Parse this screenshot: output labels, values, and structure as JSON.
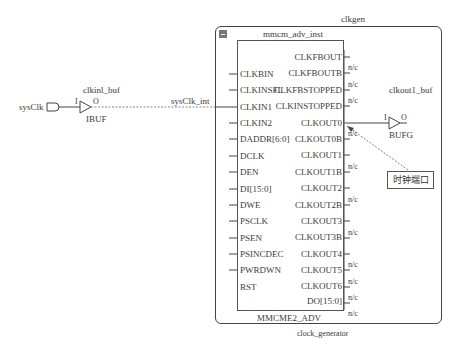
{
  "diagram": {
    "type": "schematic",
    "top_module": {
      "instance_name": "clkgen",
      "module_name": "clock_generator"
    },
    "primitive": {
      "instance_name": "mmcm_adv_inst",
      "cell_type": "MMCME2_ADV",
      "inputs": [
        "CLKBIN",
        "CLKINSFL",
        "CLKIN1",
        "CLKIN2",
        "DADDR[6:0]",
        "DCLK",
        "DEN",
        "DI[15:0]",
        "DWE",
        "PSCLK",
        "PSEN",
        "PSINCDEC",
        "PWRDWN",
        "RST"
      ],
      "outputs": [
        {
          "name": "CLKFBOUT",
          "nc": ""
        },
        {
          "name": "CLKFBOUTB",
          "nc": "n/c"
        },
        {
          "name": "CLKFBSTOPPED",
          "nc": "n/c"
        },
        {
          "name": "CLKINSTOPPED",
          "nc": "n/c"
        },
        {
          "name": "CLKOUT0",
          "nc": ""
        },
        {
          "name": "CLKOUT0B",
          "nc": "n/c"
        },
        {
          "name": "CLKOUT1",
          "nc": ""
        },
        {
          "name": "CLKOUT1B",
          "nc": "n/c"
        },
        {
          "name": "CLKOUT2",
          "nc": ""
        },
        {
          "name": "CLKOUT2B",
          "nc": "n/c"
        },
        {
          "name": "CLKOUT3",
          "nc": ""
        },
        {
          "name": "CLKOUT3B",
          "nc": "n/c"
        },
        {
          "name": "CLKOUT4",
          "nc": ""
        },
        {
          "name": "CLKOUT5",
          "nc": "n/c"
        },
        {
          "name": "CLKOUT6",
          "nc": "n/c"
        },
        {
          "name": "DO[15:0]",
          "nc": "n/c"
        },
        {
          "name": "DRDY",
          "nc": "n/c"
        },
        {
          "name": "LOCKED",
          "nc": "n/c"
        },
        {
          "name": "PSDONE",
          "nc": "n/c"
        }
      ]
    },
    "input_port": {
      "name": "sysClk"
    },
    "ibuf": {
      "instance_name": "clkinl_buf",
      "cell_type": "IBUF",
      "pin_in": "I",
      "pin_out": "O"
    },
    "net": {
      "name": "sysClk_int"
    },
    "bufg": {
      "instance_name": "clkout1_buf",
      "cell_type": "BUFG",
      "pin_in": "I",
      "pin_out": "O"
    },
    "annotation": {
      "text": "时钟端口"
    }
  }
}
